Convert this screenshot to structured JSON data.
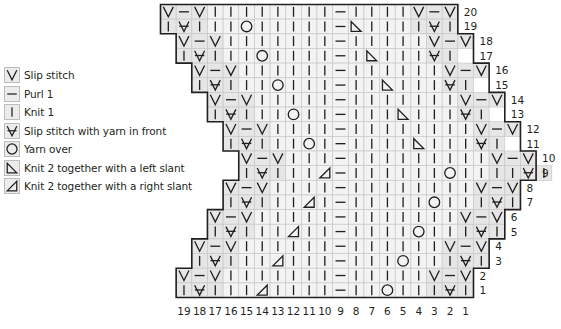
{
  "legend": [
    {
      "symbol": "slip",
      "label": "Slip stitch"
    },
    {
      "symbol": "purl",
      "label": "Purl 1"
    },
    {
      "symbol": "knit",
      "label": "Knit 1"
    },
    {
      "symbol": "slip_wyif",
      "label": "Slip stitch with yarn in front"
    },
    {
      "symbol": "yo",
      "label": "Yarn over"
    },
    {
      "symbol": "k2tog_left",
      "label": "Knit 2 together with a left slant"
    },
    {
      "symbol": "k2tog_right",
      "label": "Knit 2 together with a right slant"
    }
  ],
  "chart_data": {
    "type": "table",
    "stitches_per_row": 19,
    "column_labels": [
      "19",
      "18",
      "17",
      "16",
      "15",
      "14",
      "13",
      "12",
      "11",
      "10",
      "9",
      "8",
      "7",
      "6",
      "5",
      "4",
      "3",
      "2",
      "1"
    ],
    "symbol_key": {
      "V": "slip",
      "-": "purl",
      "|": "knit",
      "A": "slip_wyif",
      "O": "yo",
      "L": "k2tog_left",
      "R": "k2tog_right"
    },
    "rows": [
      {
        "number": "20",
        "shift": 0,
        "stitches": "V-V||||||||-||||V-V"
      },
      {
        "number": "19",
        "shift": 0,
        "stitches": "|A|||O|||||-L||||A|"
      },
      {
        "number": "18",
        "shift": 1,
        "stitches": "V-V|||||||-|||||V-V"
      },
      {
        "number": "17",
        "shift": 1,
        "stitches": "|A|||O||||-|L|||A|"
      },
      {
        "number": "16",
        "shift": 2,
        "stitches": "V-V||||||-||||||V-V"
      },
      {
        "number": "15",
        "shift": 2,
        "stitches": "|A|||O|||-||L|||A|"
      },
      {
        "number": "14",
        "shift": 3,
        "stitches": "V-V|||||-|||||||V-V"
      },
      {
        "number": "13",
        "shift": 3,
        "stitches": "|A|||O||-|||L|||A|"
      },
      {
        "number": "12",
        "shift": 4,
        "stitches": "V-V||||-||||||||V-V"
      },
      {
        "number": "11",
        "shift": 4,
        "stitches": "|A|||O|-||||L|||A|"
      },
      {
        "number": "10",
        "shift": 5,
        "stitches": "V-V|||-|||||||||V-V"
      },
      {
        "number": "9",
        "shift": 5,
        "stitches": "|A|||R-||||||O||||A|"
      },
      {
        "number": "8",
        "shift": 4,
        "stitches": "V-V||||-||||||||V-V"
      },
      {
        "number": "7",
        "shift": 4,
        "stitches": "|A|||R|-|||||O|||A|"
      },
      {
        "number": "6",
        "shift": 3,
        "stitches": "V-V|||||-|||||||V-V"
      },
      {
        "number": "5",
        "shift": 3,
        "stitches": "|A|||R||-||||O|||A|"
      },
      {
        "number": "4",
        "shift": 2,
        "stitches": "V-V||||||-||||||V-V"
      },
      {
        "number": "3",
        "shift": 2,
        "stitches": "|A|||R|||-|||O|||A|"
      },
      {
        "number": "2",
        "shift": 1,
        "stitches": "V-V|||||||-|||||V-V"
      },
      {
        "number": "1",
        "shift": 1,
        "stitches": "|A|||R||||-||O|||A|"
      }
    ]
  }
}
